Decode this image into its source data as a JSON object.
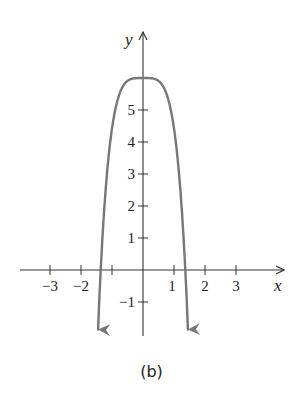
{
  "chart_data": {
    "type": "line",
    "title": "",
    "caption": "(b)",
    "xlabel": "x",
    "ylabel": "y",
    "x_ticks": [
      -3,
      -2,
      -1,
      1,
      2,
      3
    ],
    "x_tick_labels": [
      "−3",
      "−2",
      "",
      "1",
      "2",
      "3"
    ],
    "y_ticks": [
      -1,
      1,
      2,
      3,
      4,
      5
    ],
    "y_tick_labels": [
      "−1",
      "1",
      "2",
      "3",
      "4",
      "5"
    ],
    "xlim": [
      -3.9,
      4.5
    ],
    "ylim": [
      -2.1,
      7.2
    ],
    "grid": false,
    "legend": null,
    "series": [
      {
        "name": "curve",
        "description": "Even-degree polynomial with flat maximum at (0, 6), opening downward, with arrows at both ends",
        "x": [
          -1.45,
          -1.35,
          -1.25,
          -1.0,
          -0.75,
          -0.5,
          -0.25,
          0,
          0.25,
          0.5,
          0.75,
          1.0,
          1.25,
          1.35,
          1.45
        ],
        "values": [
          -2.1,
          -0.6,
          0.9,
          4.0,
          5.4,
          5.9,
          6.0,
          6.0,
          6.0,
          5.9,
          5.4,
          4.0,
          0.9,
          -0.6,
          -2.1
        ],
        "color": "#777777",
        "end_arrows": true
      }
    ]
  },
  "colors": {
    "axis": "#333333",
    "curve": "#777777",
    "background": "#ffffff"
  }
}
